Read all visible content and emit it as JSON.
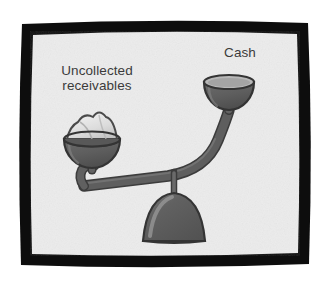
{
  "illustration": {
    "title": "Unbalanced scale comparing uncollected receivables against cash",
    "frame": {
      "border_color": "#0d0d0d",
      "panel_color": "#ececec"
    },
    "palette": {
      "background": "#ffffff",
      "panel": "#ececec",
      "metal_dark": "#5e5e5e",
      "metal_outline": "#3c3c3c",
      "metal_highlight": "#b8b8b8",
      "paper_pile": "#e4e4e4",
      "paper_shadow": "#bdbdbd",
      "text": "#3b3b3b"
    },
    "labels": {
      "left": "Uncollected\nreceivables",
      "right": "Cash"
    },
    "pans": {
      "left": {
        "name": "uncollected-receivables-pan",
        "state": "heavy",
        "position": "lowered",
        "contents": "overflowing pile of papers"
      },
      "right": {
        "name": "cash-pan",
        "state": "empty",
        "position": "raised",
        "contents": "empty bowl"
      }
    },
    "fulcrum": {
      "shape": "dome",
      "pin": "vertical pivot pin"
    }
  }
}
